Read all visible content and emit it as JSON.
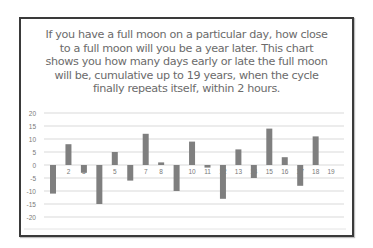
{
  "chart_data": {
    "type": "bar",
    "title_lines": [
      "If you have a full moon on a particular day, how close",
      "to a full moon will you be a year later. This chart",
      "shows you how many days early or late the full moon",
      "will be, cumulative up to 19 years, when the cycle",
      "finally repeats itself, within 2 hours."
    ],
    "xlabel": "",
    "ylabel": "",
    "categories": [
      "1",
      "2",
      "3",
      "4",
      "5",
      "6",
      "7",
      "8",
      "9",
      "10",
      "11",
      "12",
      "13",
      "14",
      "15",
      "16",
      "17",
      "18",
      "19"
    ],
    "values": [
      -11,
      8,
      -3,
      -15,
      5,
      -6,
      12,
      1,
      -10,
      9,
      -1,
      -13,
      6,
      -5,
      14,
      3,
      -8,
      11,
      0
    ],
    "ylim": [
      -20,
      20
    ],
    "yticks": [
      20,
      15,
      10,
      5,
      0,
      -5,
      -10,
      -15,
      -20
    ],
    "grid": true,
    "legend": "none",
    "colors": {
      "bar": "#7f7f7f",
      "grid": "#d9d9d9",
      "text": "#7a7a7a",
      "frame": "#3a3a3a"
    }
  }
}
